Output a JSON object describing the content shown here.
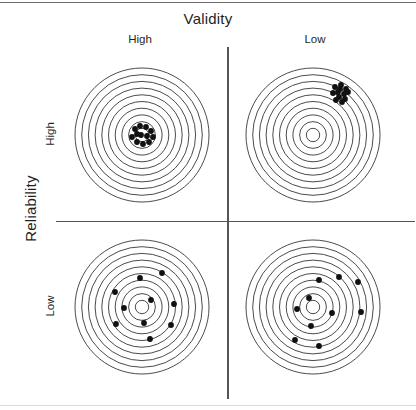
{
  "figure": {
    "column_axis_title": "Validity",
    "row_axis_title": "Reliability",
    "column_labels": [
      "High",
      "Low"
    ],
    "row_labels": [
      "High",
      "Low"
    ],
    "line_color": "#2b2b2b",
    "shot_color": "#111111",
    "divider_color": "#555555",
    "background": "#ffffff"
  },
  "chart_data": {
    "type": "scatter",
    "title": "Validity",
    "xlabel": "Validity",
    "ylabel": "Reliability",
    "x_categories": [
      "High",
      "Low"
    ],
    "y_categories": [
      "High",
      "Low"
    ],
    "grid": false,
    "legend": "none",
    "rings_per_target": 10,
    "target_outer_radius": 67,
    "targets": [
      {
        "name": "high-validity-high-reliability",
        "validity": "High",
        "reliability": "High",
        "center": [
          142,
          135
        ],
        "description": "tight cluster on bullseye",
        "shots": [
          [
            -7,
            -6
          ],
          [
            -2,
            -9
          ],
          [
            4,
            -8
          ],
          [
            9,
            -4
          ],
          [
            11,
            2
          ],
          [
            7,
            7
          ],
          [
            1,
            9
          ],
          [
            -5,
            7
          ],
          [
            -10,
            2
          ],
          [
            -1,
            0
          ],
          [
            5,
            1
          ],
          [
            -5,
            -1
          ]
        ]
      },
      {
        "name": "low-validity-high-reliability",
        "validity": "Low",
        "reliability": "High",
        "center": [
          313,
          135
        ],
        "description": "tight cluster off-center, upper right",
        "shots": [
          [
            22,
            -48
          ],
          [
            28,
            -50
          ],
          [
            33,
            -46
          ],
          [
            25,
            -43
          ],
          [
            31,
            -41
          ],
          [
            20,
            -42
          ],
          [
            26,
            -38
          ],
          [
            32,
            -36
          ],
          [
            23,
            -35
          ],
          [
            29,
            -33
          ],
          [
            35,
            -43
          ],
          [
            27,
            -46
          ]
        ]
      },
      {
        "name": "high-validity-low-reliability",
        "validity": "High",
        "reliability": "Low",
        "center": [
          142,
          307
        ],
        "description": "shots scattered evenly around the bullseye",
        "shots": [
          [
            -2,
            -29
          ],
          [
            20,
            -34
          ],
          [
            -27,
            -15
          ],
          [
            9,
            -7
          ],
          [
            -18,
            1
          ],
          [
            32,
            -3
          ],
          [
            -26,
            17
          ],
          [
            2,
            16
          ],
          [
            29,
            18
          ],
          [
            8,
            32
          ]
        ]
      },
      {
        "name": "low-validity-low-reliability",
        "validity": "Low",
        "reliability": "Low",
        "center": [
          313,
          307
        ],
        "description": "shots scattered and biased toward lower right",
        "shots": [
          [
            6,
            -27
          ],
          [
            26,
            -30
          ],
          [
            45,
            -25
          ],
          [
            -4,
            -9
          ],
          [
            -16,
            2
          ],
          [
            19,
            6
          ],
          [
            48,
            5
          ],
          [
            -2,
            19
          ],
          [
            -18,
            33
          ],
          [
            6,
            39
          ]
        ]
      }
    ]
  }
}
